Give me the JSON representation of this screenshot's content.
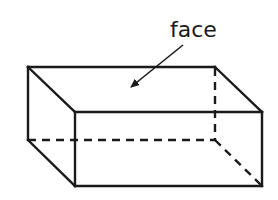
{
  "diagram": {
    "shape": "rectangular-prism",
    "label": "face",
    "label_points_to": "top face",
    "visible_edges": 9,
    "hidden_edges": 3,
    "colors": {
      "line": "#1a1a1a",
      "background": "#ffffff"
    }
  }
}
